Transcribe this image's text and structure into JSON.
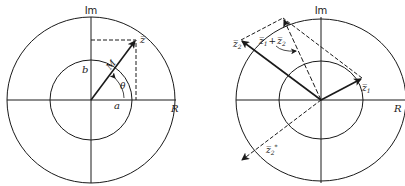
{
  "left_diagram": {
    "axis_imag_label": "Im",
    "axis_real_label": "R",
    "vector_label": "z̅",
    "magnitude_label": "M",
    "angle_label": "θ",
    "real_component_label": "a",
    "imag_component_label": "b"
  },
  "right_diagram": {
    "axis_imag_label": "Im",
    "axis_real_label": "R",
    "vector1_label": "z̅",
    "vector1_sub": "1",
    "vector2_label": "z̅",
    "vector2_sub": "2",
    "sum_label_a": "z̅",
    "sum_sub_a": "1",
    "sum_plus": "+",
    "sum_label_b": "z̅",
    "sum_sub_b": "2",
    "conjugate_label": "z̅",
    "conjugate_sub": "2",
    "conjugate_sup": "*"
  },
  "colors": {
    "ink": "#1a1a1a",
    "background": "#ffffff"
  }
}
